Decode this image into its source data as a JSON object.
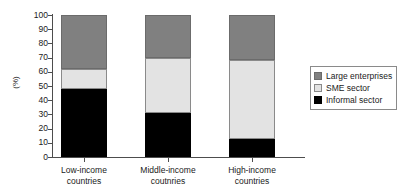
{
  "chart_data": {
    "type": "bar",
    "subtype": "stacked-percentage",
    "title": "",
    "xlabel": "",
    "ylabel": "(%)",
    "ylim": [
      0,
      100
    ],
    "yticks": [
      0,
      10,
      20,
      30,
      40,
      50,
      60,
      70,
      80,
      90,
      100
    ],
    "ytick_labels": [
      "0",
      "10",
      "20",
      "30",
      "40",
      "50",
      "60",
      "70",
      "80",
      "90",
      "100"
    ],
    "grid": false,
    "legend_position": "right",
    "categories": [
      "Low-income countries",
      "Middle-income coutnries",
      "High-income countries"
    ],
    "category_lines": [
      [
        "Low-income",
        "countries"
      ],
      [
        "Middle-income",
        "coutnries"
      ],
      [
        "High-income",
        "countries"
      ]
    ],
    "series": [
      {
        "name": "Large enterprises",
        "color": "#808080",
        "values": [
          38,
          30,
          32
        ]
      },
      {
        "name": "SME sector",
        "color": "#e3e3e3",
        "values": [
          14,
          39,
          55
        ]
      },
      {
        "name": "Informal sector",
        "color": "#000000",
        "values": [
          48,
          31,
          13
        ]
      }
    ],
    "stack_order_bottom_to_top": [
      "Informal sector",
      "SME sector",
      "Large enterprises"
    ]
  },
  "legend": {
    "items": [
      {
        "label": "Large enterprises",
        "swatch": "large"
      },
      {
        "label": "SME sector",
        "swatch": "sme"
      },
      {
        "label": "Informal sector",
        "swatch": "informal"
      }
    ]
  },
  "axis": {
    "y_title": "(%)"
  }
}
